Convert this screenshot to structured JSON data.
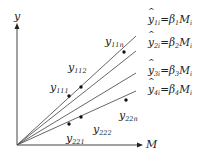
{
  "diagram": {
    "axes": {
      "x_label": "M",
      "y_label": "y"
    },
    "equations": [
      {
        "lhs_base": "y",
        "lhs_sub": "1i",
        "eq": "=",
        "beta": "β",
        "beta_sub": "1",
        "rhs": "M",
        "rhs_sub": "i"
      },
      {
        "lhs_base": "y",
        "lhs_sub": "2i",
        "eq": "=",
        "beta": "β",
        "beta_sub": "2",
        "rhs": "M",
        "rhs_sub": "i"
      },
      {
        "lhs_base": "y",
        "lhs_sub": "3i",
        "eq": "=",
        "beta": "β",
        "beta_sub": "3",
        "rhs": "M",
        "rhs_sub": "i"
      },
      {
        "lhs_base": "y",
        "lhs_sub": "4i",
        "eq": "=",
        "beta": "β",
        "beta_sub": "4",
        "rhs": "M",
        "rhs_sub": "i"
      }
    ],
    "point_labels": [
      {
        "base": "y",
        "sub": "11n"
      },
      {
        "base": "y",
        "sub": "112"
      },
      {
        "base": "y",
        "sub": "111"
      },
      {
        "base": "y",
        "sub": "22n"
      },
      {
        "base": "y",
        "sub": "222"
      },
      {
        "base": "y",
        "sub": "221"
      }
    ],
    "lines": [
      {
        "name": "line-1",
        "slope_end_y": 36
      },
      {
        "name": "line-2",
        "slope_end_y": 51
      },
      {
        "name": "line-3",
        "slope_end_y": 73
      },
      {
        "name": "line-4",
        "slope_end_y": 91
      }
    ],
    "points": [
      {
        "label": "y11n",
        "x": 124,
        "y": 52
      },
      {
        "label": "y112",
        "x": 81,
        "y": 87
      },
      {
        "label": "y111",
        "x": 69,
        "y": 96
      },
      {
        "label": "y22n",
        "x": 126,
        "y": 100
      },
      {
        "label": "y222",
        "x": 81,
        "y": 117
      },
      {
        "label": "y221",
        "x": 69,
        "y": 124
      }
    ],
    "colors": {
      "axis": "#444444",
      "line": "#555555",
      "point": "#111111",
      "text": "#222222"
    }
  }
}
